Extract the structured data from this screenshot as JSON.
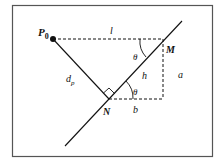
{
  "diagram": {
    "labels": {
      "p0_main": "P",
      "p0_sub": "0",
      "l": "l",
      "theta_top": "θ",
      "M": "M",
      "h": "h",
      "a": "a",
      "dp_main": "d",
      "dp_sub": "p",
      "theta_bottom": "θ",
      "N": "N",
      "b": "b"
    },
    "colors": {
      "stroke": "#111111",
      "border": "#555555",
      "background": "#ffffff"
    }
  }
}
